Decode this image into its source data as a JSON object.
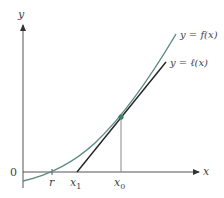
{
  "diagram": {
    "type": "tangent-line-newton-method",
    "axes": {
      "x_label": "x",
      "y_label": "y",
      "origin_label": "0"
    },
    "curve": {
      "label": "y = f(x)",
      "color": "#5b8a82"
    },
    "tangent": {
      "label": "y = ℓ(x)",
      "color": "#222222"
    },
    "points": {
      "root_label": "r",
      "x1_label": "x",
      "x1_sub": "1",
      "x0_label": "x",
      "x0_sub": "0"
    },
    "tangent_point_color": "#3f7a6e",
    "axis_color": "#555555",
    "dropline_color": "#888888"
  }
}
